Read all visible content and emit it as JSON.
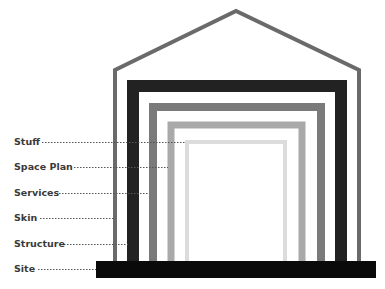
{
  "diagram": {
    "layers": [
      {
        "label": "Stuff",
        "y": 142,
        "line_end": 186,
        "color": "#dcdcdc"
      },
      {
        "label": "Space Plan",
        "y": 167,
        "line_end": 168,
        "color": "#a9a9a9"
      },
      {
        "label": "Services",
        "y": 193,
        "line_end": 149,
        "color": "#7a7a7a"
      },
      {
        "label": "Skin",
        "y": 218,
        "line_end": 114,
        "color": "#6a6a6a"
      },
      {
        "label": "Structure",
        "y": 244,
        "line_end": 128,
        "color": "#222222"
      },
      {
        "label": "Site",
        "y": 269,
        "line_end": 96,
        "color": "#0a0a0a"
      }
    ]
  },
  "colors": {
    "skin": "#6a6a6a",
    "structure": "#222222",
    "services": "#7a7a7a",
    "space_plan": "#a9a9a9",
    "stuff": "#dcdcdc",
    "site": "#0a0a0a",
    "label": "#3a3a3a",
    "dots": "#555555"
  }
}
